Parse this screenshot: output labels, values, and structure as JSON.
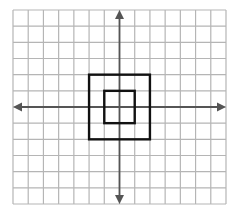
{
  "diagram": {
    "type": "coordinate-grid",
    "grid": {
      "columns": 14,
      "rows": 12,
      "left": 13,
      "top": 10,
      "right": 226,
      "bottom": 204,
      "line_color": "#b5b5b5"
    },
    "axes": {
      "color": "#555555",
      "x_axis_row": 6,
      "y_axis_col": 7,
      "arrows": [
        "left",
        "right",
        "up",
        "down"
      ]
    },
    "shapes": [
      {
        "name": "outer-square",
        "col_from": 5,
        "col_to": 9,
        "row_from": 4,
        "row_to": 8,
        "stroke": "#111111"
      },
      {
        "name": "inner-square",
        "col_from": 6,
        "col_to": 8,
        "row_from": 5,
        "row_to": 7,
        "stroke": "#111111"
      }
    ]
  }
}
